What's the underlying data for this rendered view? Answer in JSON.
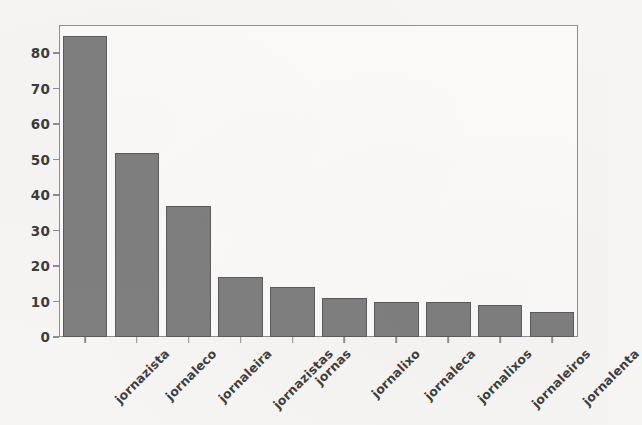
{
  "chart_data": {
    "type": "bar",
    "title": "",
    "xlabel": "",
    "ylabel": "",
    "categories": [
      "jornazista",
      "jornaleco",
      "jornaleira",
      "jornazistas",
      "jornas",
      "jornalixo",
      "jornaleca",
      "jornalixos",
      "jornaleiros",
      "jornalenta"
    ],
    "values": [
      85,
      52,
      37,
      17,
      14,
      11,
      10,
      10,
      9,
      7
    ],
    "ylim": [
      0,
      88
    ],
    "yticks": [
      0,
      10,
      20,
      30,
      40,
      50,
      60,
      70,
      80
    ],
    "ytick_labels": [
      "0",
      "10",
      "20",
      "30",
      "40",
      "50",
      "60",
      "70",
      "80"
    ],
    "grid": false,
    "legend": false,
    "legend_position": "none",
    "bar_color": "#7f7f80",
    "bar_edge_color": "#5b5b5d",
    "axes_color": "#8e8e90",
    "tick_label_color": "#3c3c3e",
    "background_color": "#f6f5f3",
    "plot_background_color": "#fbfaf8",
    "xtick_rotation": -45,
    "bar_width_fraction": 0.86
  }
}
